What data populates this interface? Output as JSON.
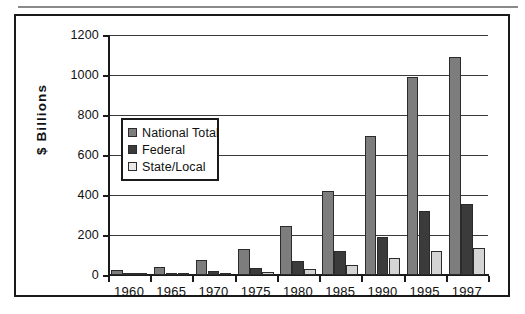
{
  "chart_data": {
    "type": "bar",
    "title": "",
    "xlabel": "",
    "ylabel": "$ Billions",
    "ylim": [
      0,
      1200
    ],
    "yticks": [
      0,
      200,
      400,
      600,
      800,
      1000,
      1200
    ],
    "grid": true,
    "legend_position": "inside-left",
    "categories": [
      "1960",
      "1965",
      "1970",
      "1975",
      "1980",
      "1985",
      "1990",
      "1995",
      "1997"
    ],
    "series": [
      {
        "name": "National Total",
        "color": "#7d7d7d",
        "values": [
          27,
          42,
          75,
          130,
          245,
          420,
          695,
          988,
          1092
        ]
      },
      {
        "name": "Federal",
        "color": "#3b3b3b",
        "values": [
          3,
          6,
          18,
          35,
          70,
          120,
          190,
          320,
          355
        ]
      },
      {
        "name": "State/Local",
        "color": "#d4d4d4",
        "values": [
          2,
          4,
          8,
          15,
          32,
          48,
          85,
          120,
          135
        ]
      }
    ]
  },
  "axis": {
    "y_title": "$ Billions",
    "y_tick_labels": [
      "1200",
      "1000",
      "800",
      "600",
      "400",
      "200",
      "0"
    ],
    "x_tick_labels": [
      "1960",
      "1965",
      "1970",
      "1975",
      "1980",
      "1985",
      "1990",
      "1995",
      "1997"
    ]
  },
  "legend": {
    "items": [
      {
        "label": "National Total",
        "swatch": "national"
      },
      {
        "label": "Federal",
        "swatch": "federal"
      },
      {
        "label": "State/Local",
        "swatch": "statelocal"
      }
    ]
  }
}
